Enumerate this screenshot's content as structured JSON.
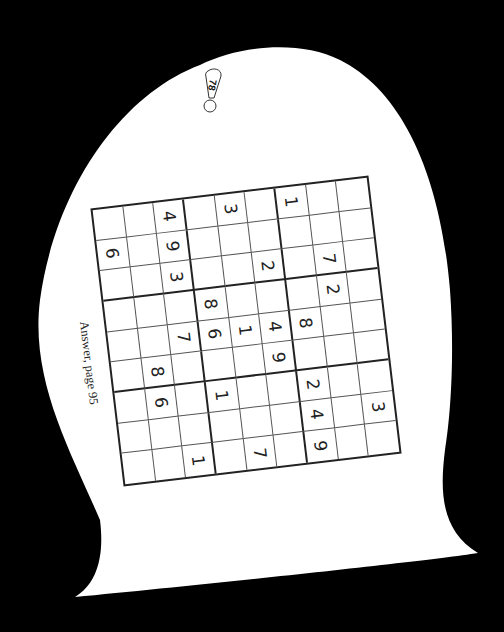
{
  "page": {
    "number_badge": "78",
    "answer_note": "Answer, page 95",
    "background_color": "#000000",
    "paper_color": "#ffffff"
  },
  "puzzle": {
    "type": "sudoku",
    "size": 9,
    "rows": [
      [
        "",
        "",
        "4",
        "",
        "3",
        "",
        "1",
        "",
        ""
      ],
      [
        "6",
        "",
        "9",
        "",
        "",
        "",
        "",
        "",
        ""
      ],
      [
        "",
        "",
        "3",
        "",
        "",
        "2",
        "",
        "7",
        ""
      ],
      [
        "",
        "",
        "",
        "8",
        "",
        "",
        "",
        "2",
        ""
      ],
      [
        "",
        "",
        "7",
        "6",
        "1",
        "4",
        "8",
        "",
        ""
      ],
      [
        "",
        "8",
        "",
        "",
        "",
        "9",
        "",
        "",
        ""
      ],
      [
        "",
        "6",
        "",
        "1",
        "",
        "",
        "2",
        "",
        ""
      ],
      [
        "",
        "",
        "",
        "",
        "",
        "",
        "4",
        "",
        "3"
      ],
      [
        "",
        "",
        "1",
        "",
        "7",
        "",
        "9",
        "",
        ""
      ]
    ]
  }
}
